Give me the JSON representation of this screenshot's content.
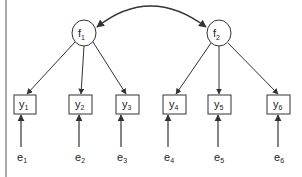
{
  "diagram": {
    "type": "structural-equation-model",
    "colors": {
      "stroke": "#333333",
      "background": "#ffffff"
    },
    "factors": [
      {
        "id": "f1",
        "base": "f",
        "sub": "1",
        "cx": 84,
        "cy": 33
      },
      {
        "id": "f2",
        "base": "f",
        "sub": "2",
        "cx": 219,
        "cy": 33
      }
    ],
    "indicators": [
      {
        "id": "y1",
        "base": "y",
        "sub": "1",
        "x": 14,
        "factor": "f1"
      },
      {
        "id": "y2",
        "base": "y",
        "sub": "2",
        "x": 69,
        "factor": "f1"
      },
      {
        "id": "y3",
        "base": "y",
        "sub": "3",
        "x": 116,
        "factor": "f1"
      },
      {
        "id": "y4",
        "base": "y",
        "sub": "4",
        "x": 163,
        "factor": "f2"
      },
      {
        "id": "y5",
        "base": "y",
        "sub": "5",
        "x": 212,
        "factor": "f2"
      },
      {
        "id": "y6",
        "base": "y",
        "sub": "6",
        "x": 270,
        "factor": "f2"
      }
    ],
    "errors": [
      {
        "id": "e1",
        "base": "e",
        "sub": "1"
      },
      {
        "id": "e2",
        "base": "e",
        "sub": "2"
      },
      {
        "id": "e3",
        "base": "e",
        "sub": "3"
      },
      {
        "id": "e4",
        "base": "e",
        "sub": "4"
      },
      {
        "id": "e5",
        "base": "e",
        "sub": "5"
      },
      {
        "id": "e6",
        "base": "e",
        "sub": "6"
      }
    ],
    "covariance": {
      "from": "f1",
      "to": "f2",
      "style": "double-headed-curve"
    }
  }
}
